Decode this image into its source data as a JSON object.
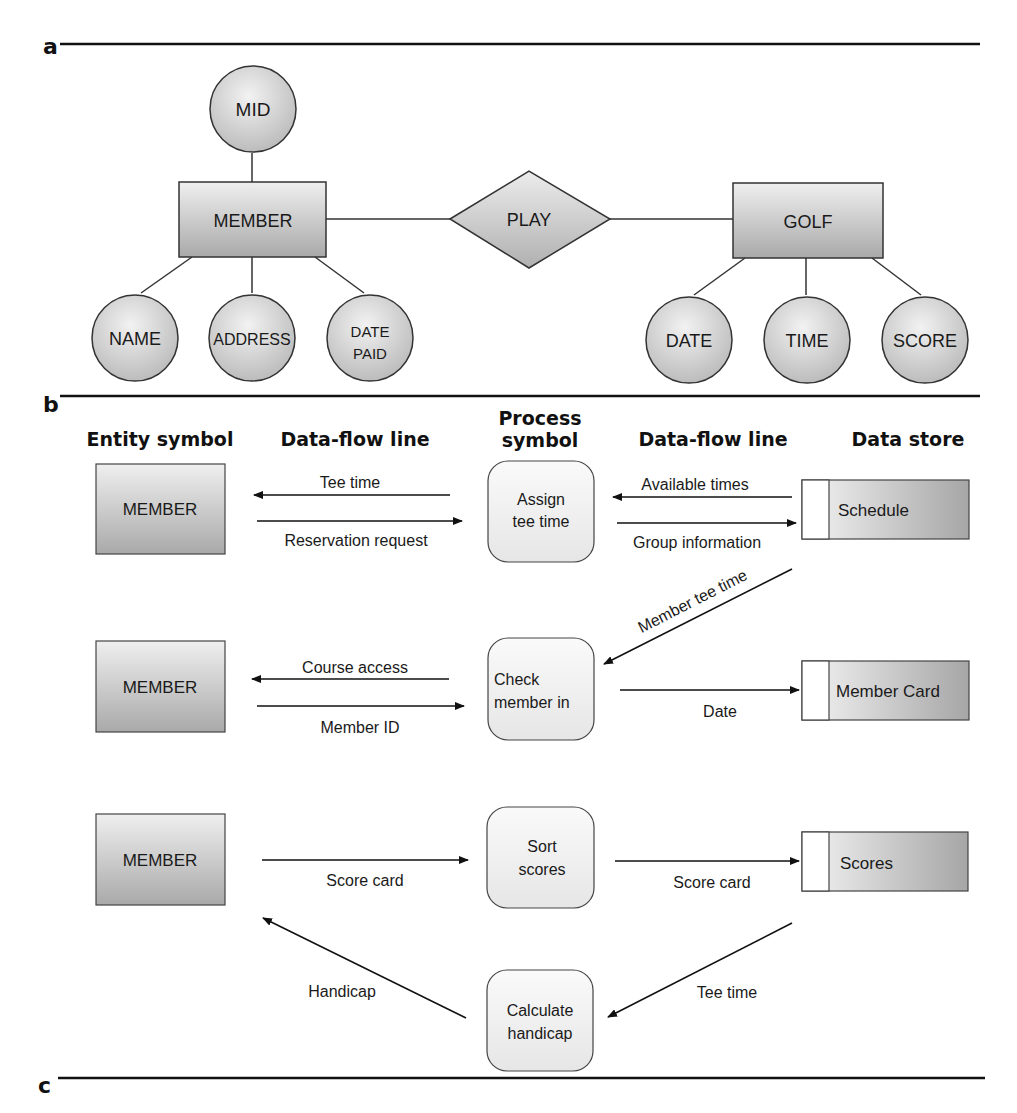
{
  "panels": {
    "a": {
      "label": "a"
    },
    "b": {
      "label": "b"
    },
    "c": {
      "label": "c"
    }
  },
  "er_diagram": {
    "entities": [
      {
        "id": "member",
        "label": "MEMBER"
      },
      {
        "id": "golf",
        "label": "GOLF"
      }
    ],
    "relationship": {
      "label": "PLAY"
    },
    "attributes": {
      "member_key": {
        "label": "MID"
      },
      "name": {
        "label": "NAME"
      },
      "address": {
        "label": "ADDRESS"
      },
      "date_paid": {
        "line1": "DATE",
        "line2": "PAID"
      },
      "date": {
        "label": "DATE"
      },
      "time": {
        "label": "TIME"
      },
      "score": {
        "label": "SCORE"
      }
    }
  },
  "legend": {
    "entity_symbol": "Entity symbol",
    "data_flow_line_left": "Data-flow line",
    "process_symbol_line1": "Process",
    "process_symbol_line2": "symbol",
    "data_flow_line_right": "Data-flow line",
    "data_store": "Data store"
  },
  "dfd": {
    "row1": {
      "entity": "MEMBER",
      "process_line1": "Assign",
      "process_line2": "tee time",
      "store": "Schedule",
      "flow_to_entity": "Tee time",
      "flow_to_process": "Reservation request",
      "flow_from_store": "Available times",
      "flow_to_store": "Group information"
    },
    "cross_flow": "Member tee time",
    "row2": {
      "entity": "MEMBER",
      "process_line1": "Check",
      "process_line2": "member in",
      "store": "Member Card",
      "flow_to_entity": "Course access",
      "flow_to_process": "Member ID",
      "flow_to_store": "Date"
    },
    "row3": {
      "entity": "MEMBER",
      "process_line1": "Sort",
      "process_line2": "scores",
      "store": "Scores",
      "flow_to_process": "Score card",
      "flow_to_store": "Score card"
    },
    "row4": {
      "process_line1": "Calculate",
      "process_line2": "handicap",
      "flow_to_entity": "Handicap",
      "flow_from_store": "Tee time"
    }
  }
}
